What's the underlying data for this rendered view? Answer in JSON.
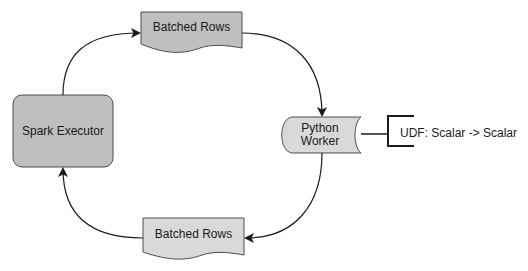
{
  "diagram": {
    "title": "",
    "nodes": {
      "spark_executor": {
        "label": "Spark Executor",
        "fill": "#bfbfbf",
        "shape": "rounded-rectangle"
      },
      "batched_rows_top": {
        "label": "Batched Rows",
        "fill": "#bfbfbf",
        "shape": "document"
      },
      "python_worker": {
        "label": "Python\nWorker",
        "fill": "#d9d9d9",
        "shape": "stored-data"
      },
      "batched_rows_bottom": {
        "label": "Batched Rows",
        "fill": "#d9d9d9",
        "shape": "document"
      },
      "udf_annotation": {
        "label": "UDF: Scalar -> Scalar",
        "shape": "bracket-annotation"
      }
    },
    "edges": [
      {
        "from": "spark_executor",
        "to": "batched_rows_top",
        "label": ""
      },
      {
        "from": "batched_rows_top",
        "to": "python_worker",
        "label": ""
      },
      {
        "from": "python_worker",
        "to": "batched_rows_bottom",
        "label": ""
      },
      {
        "from": "batched_rows_bottom",
        "to": "spark_executor",
        "label": ""
      },
      {
        "from": "python_worker",
        "to": "udf_annotation",
        "label": "",
        "style": "plain-line"
      }
    ],
    "colors": {
      "stroke": "#4d4d4d",
      "arrow": "#1a1a1a",
      "dark_fill": "#bfbfbf",
      "light_fill": "#d9d9d9",
      "text": "#1a1a1a"
    }
  }
}
